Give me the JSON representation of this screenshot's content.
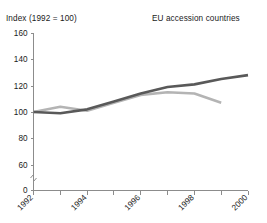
{
  "header": {
    "index_label": "Index (1992 = 100)",
    "series_title": "EU accession countries"
  },
  "chart_data": {
    "type": "line",
    "title": "EU accession countries",
    "subtitle": "Index (1992 = 100)",
    "xlabel": "",
    "ylabel": "Index (1992 = 100)",
    "x": [
      1992,
      1993,
      1994,
      1995,
      1996,
      1997,
      1998,
      1999,
      2000
    ],
    "xticks": [
      1992,
      1993,
      1994,
      1995,
      1996,
      1997,
      1998,
      1999,
      2000
    ],
    "xtick_labels": [
      "1992",
      "",
      "1994",
      "",
      "1996",
      "",
      "1998",
      "",
      "2000"
    ],
    "xlim": [
      1992,
      2000
    ],
    "yticks": [
      0,
      60,
      80,
      100,
      120,
      140,
      160
    ],
    "ytick_labels": [
      "0",
      "60",
      "80",
      "100",
      "120",
      "140",
      "160"
    ],
    "ylim": [
      60,
      160
    ],
    "axis_break": true,
    "grid": false,
    "legend": "none",
    "series": [
      {
        "name": "dark-series",
        "color": "#595959",
        "width": 2.6,
        "x": [
          1992,
          1993,
          1994,
          1995,
          1996,
          1997,
          1998,
          1999,
          2000
        ],
        "values": [
          100,
          99,
          102,
          108,
          114,
          119,
          121,
          125,
          128
        ]
      },
      {
        "name": "light-series",
        "color": "#b4b4b4",
        "width": 2.6,
        "x": [
          1992,
          1993,
          1994,
          1995,
          1996,
          1997,
          1998,
          1999
        ],
        "values": [
          100,
          104,
          101,
          107,
          113,
          115,
          114,
          107
        ]
      }
    ]
  },
  "colors": {
    "background": "#ffffff",
    "axis": "#8c8c8c",
    "text": "#1a1a1a",
    "dark_series": "#595959",
    "light_series": "#b4b4b4"
  }
}
